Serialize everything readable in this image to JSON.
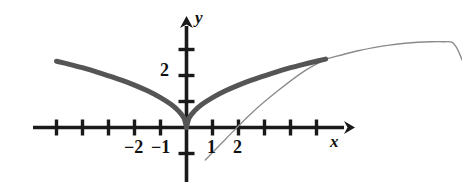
{
  "figure": {
    "background_color": "#ffffff",
    "ink_color": "#1a1a1a",
    "thick_curve_color": "#555555",
    "thin_curve_color": "#8a8a8a"
  },
  "axes": {
    "x_axis_label": "x",
    "y_axis_label": "y",
    "x_label_position": {
      "left": 330,
      "top": 133
    },
    "y_label_position": {
      "left": 195,
      "top": 9
    },
    "origin": {
      "x": 186,
      "y": 127
    },
    "unit_px": 26,
    "x_axis": {
      "start_x": 33,
      "end_x": 352,
      "arrow": "right"
    },
    "y_axis": {
      "start_y": 182,
      "end_y": 17,
      "arrow": "up"
    },
    "x_ticks": [
      -5,
      -4,
      -3,
      -2,
      -1,
      1,
      2,
      3,
      4,
      5
    ],
    "y_ticks": [
      -1,
      1,
      2,
      3
    ],
    "tick_half_length_px": 8,
    "grid": false
  },
  "tick_labels": [
    {
      "text": "−2",
      "left": 124,
      "top": 138,
      "axis": "x",
      "value": -2
    },
    {
      "text": "−1",
      "left": 151,
      "top": 138,
      "axis": "x",
      "value": -1
    },
    {
      "text": "1",
      "left": 207,
      "top": 138,
      "axis": "x",
      "value": 1
    },
    {
      "text": "2",
      "left": 233,
      "top": 138,
      "axis": "x",
      "value": 2
    },
    {
      "text": "2",
      "left": 160,
      "top": 61,
      "axis": "y",
      "value": 2
    }
  ],
  "chart_data": {
    "type": "line",
    "title": "",
    "xlabel": "x",
    "ylabel": "y",
    "xlim": [
      -5.9,
      6.4
    ],
    "ylim": [
      -2.0,
      4.2
    ],
    "grid": false,
    "legend": "none",
    "annotations": [],
    "series": [
      {
        "name": "thick-curve-left-branch",
        "style": "thick",
        "color": "#555555",
        "linewidth_px": 5,
        "comment": "Concave branch for x<0, like y = sqrt(|x|), drawn from x=-5.0 down to origin",
        "x": [
          -5.0,
          -4.5,
          -4.0,
          -3.5,
          -3.0,
          -2.5,
          -2.0,
          -1.5,
          -1.0,
          -0.6,
          -0.3,
          -0.1,
          0.0
        ],
        "y": [
          2.55,
          2.43,
          2.3,
          2.15,
          1.99,
          1.82,
          1.63,
          1.41,
          1.15,
          0.89,
          0.63,
          0.37,
          0.0
        ]
      },
      {
        "name": "thick-curve-right-branch",
        "style": "thick",
        "color": "#555555",
        "linewidth_px": 5,
        "comment": "Concave branch for x>0 up to about x=5.35 where the thick emphasis stops",
        "x": [
          0.0,
          0.1,
          0.3,
          0.6,
          1.0,
          1.5,
          2.0,
          2.5,
          3.0,
          3.5,
          4.0,
          4.5,
          5.0,
          5.35
        ],
        "y": [
          0.0,
          0.37,
          0.63,
          0.89,
          1.15,
          1.41,
          1.63,
          1.82,
          1.99,
          2.15,
          2.3,
          2.43,
          2.55,
          2.63
        ]
      },
      {
        "name": "thin-curve-continuation",
        "style": "thin",
        "color": "#8a8a8a",
        "linewidth_px": 1.4,
        "comment": "Faint continuation of the curve past the thick portion, rising then flattening and dropping at the far right edge",
        "x": [
          5.35,
          6.0,
          6.6,
          7.2,
          7.8,
          8.4,
          8.9,
          9.4,
          9.9,
          10.2,
          10.4,
          10.6
        ],
        "y": [
          2.63,
          2.8,
          2.95,
          3.07,
          3.17,
          3.24,
          3.28,
          3.3,
          3.3,
          3.28,
          3.05,
          2.6
        ]
      },
      {
        "name": "thin-straight-line",
        "style": "thin",
        "color": "#8a8a8a",
        "linewidth_px": 1.3,
        "comment": "Nearly straight faint line through the curve region, from below the x-axis up to meet the thick curve",
        "x": [
          0.72,
          1.5,
          2.5,
          3.5,
          4.5,
          5.35
        ],
        "y": [
          -1.25,
          -0.45,
          0.55,
          1.4,
          2.15,
          2.63
        ]
      }
    ]
  }
}
